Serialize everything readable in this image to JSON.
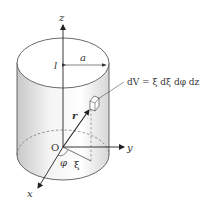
{
  "figure": {
    "type": "cylindrical-coordinates-volume-element",
    "labels": {
      "z_axis": "z",
      "y_axis": "y",
      "x_axis": "x",
      "origin": "O",
      "height": "l",
      "radius": "a",
      "position_vector": "r",
      "radial_coord": "ξ",
      "azimuth": "φ",
      "volume_element": "dV = ξ dξ dφ dz"
    },
    "colors": {
      "line": "#333333",
      "shade_dark": "#cfcfcf",
      "shade_light": "#ffffff",
      "dashed": "#666666"
    }
  }
}
